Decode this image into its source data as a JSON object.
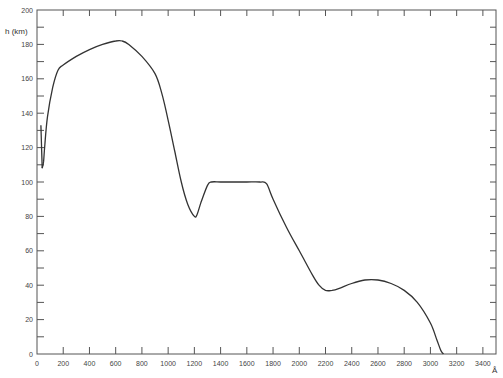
{
  "chart_data": {
    "type": "line",
    "title": "",
    "xlabel": "Å",
    "ylabel": "h (km)",
    "xlim": [
      0,
      3500
    ],
    "ylim": [
      0,
      200
    ],
    "grid": false,
    "legend": null,
    "x_ticks": [
      0,
      200,
      400,
      600,
      800,
      1000,
      1200,
      1400,
      1600,
      1800,
      2000,
      2200,
      2400,
      2600,
      2800,
      3000,
      3200,
      3400
    ],
    "y_ticks": [
      0,
      20,
      40,
      60,
      80,
      100,
      120,
      140,
      160,
      180,
      200
    ],
    "y_tick_labels": [
      "0",
      "20",
      "40",
      "60",
      "80",
      "100",
      "120",
      "140",
      "160",
      "180",
      "200"
    ],
    "x_tick_labels": [
      "0",
      "200",
      "400",
      "600",
      "800",
      "1000",
      "1200",
      "1400",
      "1600",
      "1800",
      "2000",
      "2200",
      "2400",
      "2600",
      "2800",
      "3000",
      "3200",
      "3400"
    ],
    "series": [
      {
        "name": "h",
        "x": [
          30,
          40,
          50,
          60,
          80,
          120,
          160,
          200,
          300,
          400,
          500,
          600,
          650,
          700,
          800,
          900,
          950,
          1000,
          1050,
          1100,
          1150,
          1200,
          1220,
          1250,
          1300,
          1330,
          1400,
          1500,
          1600,
          1700,
          1750,
          1800,
          1900,
          2000,
          2100,
          2150,
          2200,
          2250,
          2300,
          2400,
          2500,
          2600,
          2700,
          2800,
          2900,
          3000,
          3050,
          3080,
          3100
        ],
        "y": [
          133,
          108,
          112,
          122,
          138,
          155,
          165,
          168,
          173,
          177,
          180,
          182,
          182,
          180,
          173,
          163,
          152,
          136,
          118,
          100,
          87,
          80,
          81,
          88,
          98,
          100,
          100,
          100,
          100,
          100,
          99,
          90,
          74,
          60,
          46,
          40,
          37,
          37,
          38,
          41,
          43,
          43,
          41,
          37,
          30,
          18,
          8,
          2,
          0
        ]
      }
    ],
    "annotations": []
  }
}
